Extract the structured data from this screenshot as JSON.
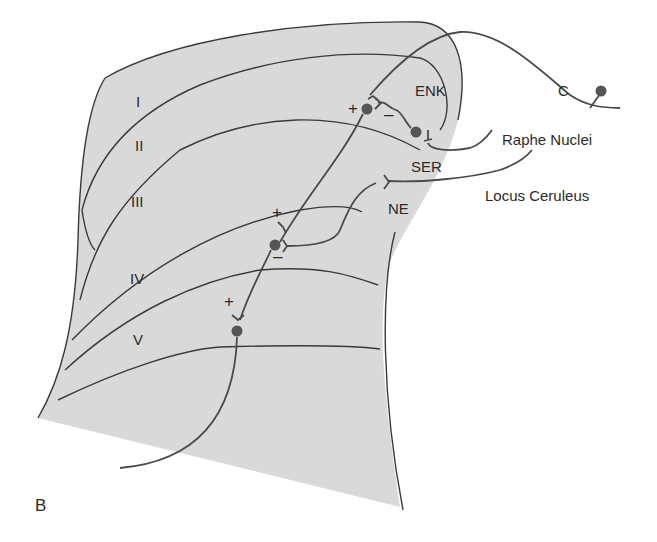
{
  "figure": {
    "panel_label": "B",
    "background_color": "#ffffff",
    "tissue_color": "#d9d9d9",
    "line_color": "#3a3a3a"
  },
  "layers": [
    {
      "label": "I"
    },
    {
      "label": "II"
    },
    {
      "label": "III"
    },
    {
      "label": "IV"
    },
    {
      "label": "V"
    }
  ],
  "neurotransmitters": {
    "enk": "ENK",
    "ser": "SER",
    "ne": "NE"
  },
  "sources": {
    "c_fiber": "C",
    "raphe": "Raphe Nuclei",
    "locus": "Locus Ceruleus"
  },
  "synapse_signs": {
    "enk_excitatory": "+",
    "enk_inhibitory": "–",
    "lamina2_plus": "+",
    "lamina2_minus": "–",
    "lamina5_plus": "+"
  }
}
